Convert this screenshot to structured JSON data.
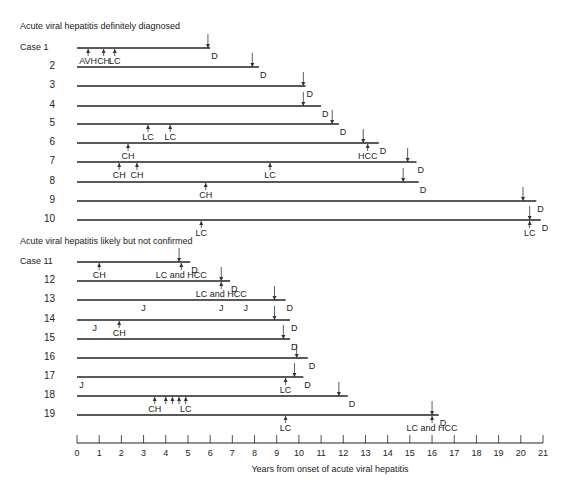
{
  "sections": [
    {
      "title": "Acute viral hepatitis definitely diagnosed",
      "y": 29
    },
    {
      "title": "Acute viral hepatitis likely but not confirmed",
      "y": 244
    }
  ],
  "axis": {
    "label": "Years from onset of acute viral hepatitis",
    "ticks": [
      "0",
      "1",
      "2",
      "3",
      "4",
      "5",
      "6",
      "7",
      "8",
      "9",
      "10",
      "11",
      "12",
      "13",
      "14",
      "15",
      "16",
      "17",
      "18",
      "19",
      "20",
      "21"
    ],
    "min": 0,
    "max": 21
  },
  "chart_data": {
    "type": "timeline",
    "title": "",
    "xlabel": "Years from onset of acute viral hepatitis",
    "xlim": [
      0,
      21
    ],
    "legend": {
      "AVH": "acute viral hepatitis",
      "CH": "chronic hepatitis",
      "LC": "liver cirrhosis",
      "HCC": "hepatocellular carcinoma",
      "D": "death",
      "J": "jaundice"
    },
    "cases": [
      {
        "label": "Case 1",
        "y": 48,
        "end": 6.0,
        "death": 5.9,
        "events": [
          {
            "x": 0.5,
            "label": "AVH",
            "dir": "up"
          },
          {
            "x": 1.2,
            "label": "CH",
            "dir": "up"
          },
          {
            "x": 1.7,
            "label": "LC",
            "dir": "up"
          }
        ]
      },
      {
        "label": "2",
        "y": 67,
        "end": 8.2,
        "death": 7.9,
        "events": []
      },
      {
        "label": "3",
        "y": 86,
        "end": 10.3,
        "death": 10.2,
        "events": []
      },
      {
        "label": "4",
        "y": 106,
        "end": 11.0,
        "death": 10.2,
        "events": []
      },
      {
        "label": "5",
        "y": 124,
        "end": 11.8,
        "death": 11.5,
        "events": [
          {
            "x": 3.2,
            "label": "LC",
            "dir": "up"
          },
          {
            "x": 4.2,
            "label": "LC",
            "dir": "up"
          }
        ]
      },
      {
        "label": "6",
        "y": 143,
        "end": 13.6,
        "death": 12.9,
        "events": [
          {
            "x": 2.3,
            "label": "CH",
            "dir": "up"
          },
          {
            "x": 13.1,
            "label": "HCC",
            "dir": "up"
          }
        ]
      },
      {
        "label": "7",
        "y": 162,
        "end": 15.3,
        "death": 14.9,
        "events": [
          {
            "x": 1.9,
            "label": "CH",
            "dir": "up"
          },
          {
            "x": 2.7,
            "label": "CH",
            "dir": "up"
          },
          {
            "x": 8.7,
            "label": "LC",
            "dir": "up"
          }
        ]
      },
      {
        "label": "8",
        "y": 182,
        "end": 15.4,
        "death": 14.7,
        "events": [
          {
            "x": 5.8,
            "label": "CH",
            "dir": "up"
          }
        ]
      },
      {
        "label": "9",
        "y": 201,
        "end": 20.7,
        "death": 20.1,
        "events": []
      },
      {
        "label": "10",
        "y": 220,
        "end": 20.9,
        "death": 20.4,
        "events": [
          {
            "x": 5.6,
            "label": "LC",
            "dir": "up"
          },
          {
            "x": 20.4,
            "label": "LC",
            "dir": "up"
          }
        ]
      },
      {
        "label": "Case 11",
        "y": 262,
        "end": 5.1,
        "death": 4.6,
        "events": [
          {
            "x": 1.0,
            "label": "CH",
            "dir": "up"
          },
          {
            "x": 4.7,
            "label": "LC and HCC",
            "dir": "up"
          }
        ]
      },
      {
        "label": "12",
        "y": 281,
        "end": 6.9,
        "death": 6.5,
        "events": [
          {
            "x": 6.5,
            "label": "LC and HCC",
            "dir": "up"
          }
        ]
      },
      {
        "label": "13",
        "y": 300,
        "end": 9.4,
        "death": 8.9,
        "events": [
          {
            "x": 3.0,
            "label": "J",
            "dir": "none"
          },
          {
            "x": 6.5,
            "label": "J",
            "dir": "none"
          },
          {
            "x": 7.6,
            "label": "J",
            "dir": "none"
          }
        ]
      },
      {
        "label": "14",
        "y": 320,
        "end": 9.6,
        "death": 8.9,
        "events": [
          {
            "x": 0.8,
            "label": "J",
            "dir": "none"
          },
          {
            "x": 1.9,
            "label": "CH",
            "dir": "up"
          }
        ]
      },
      {
        "label": "15",
        "y": 339,
        "end": 9.6,
        "death": 9.3,
        "events": []
      },
      {
        "label": "16",
        "y": 358,
        "end": 10.4,
        "death": 9.9,
        "events": []
      },
      {
        "label": "17",
        "y": 377,
        "end": 10.2,
        "death": 9.8,
        "events": [
          {
            "x": 0.2,
            "label": "J",
            "dir": "none"
          },
          {
            "x": 9.4,
            "label": "LC",
            "dir": "up"
          }
        ]
      },
      {
        "label": "18",
        "y": 396,
        "end": 12.2,
        "death": 11.8,
        "events": [
          {
            "x": 3.5,
            "label": "CH",
            "dir": "up"
          },
          {
            "x": 4.0,
            "label": "",
            "dir": "up"
          },
          {
            "x": 4.3,
            "label": "",
            "dir": "up"
          },
          {
            "x": 4.6,
            "label": "",
            "dir": "up"
          },
          {
            "x": 4.9,
            "label": "LC",
            "dir": "up"
          }
        ]
      },
      {
        "label": "19",
        "y": 415,
        "end": 16.3,
        "death": 16.0,
        "events": [
          {
            "x": 9.4,
            "label": "LC",
            "dir": "up"
          },
          {
            "x": 16.0,
            "label": "LC and HCC",
            "dir": "up"
          }
        ]
      }
    ]
  }
}
